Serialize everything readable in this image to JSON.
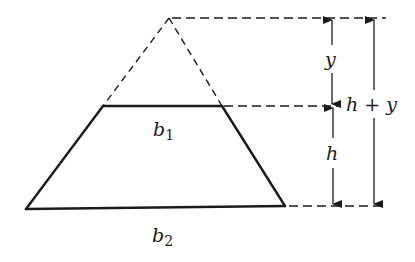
{
  "diagram": {
    "type": "geometry",
    "colors": {
      "stroke": "#1a1a1a",
      "background": "#ffffff"
    },
    "labels": {
      "top_base": {
        "main": "b",
        "sub": "1"
      },
      "bottom_base": {
        "main": "b",
        "sub": "2"
      },
      "upper_height": "y",
      "lower_height": "h",
      "total_height": "h + y"
    },
    "shapes": {
      "apex": [
        169,
        18
      ],
      "top_base_left": [
        103,
        106
      ],
      "top_base_right": [
        222,
        106
      ],
      "bottom_base_left": [
        26,
        209
      ],
      "bottom_base_right": [
        285,
        206
      ]
    }
  }
}
